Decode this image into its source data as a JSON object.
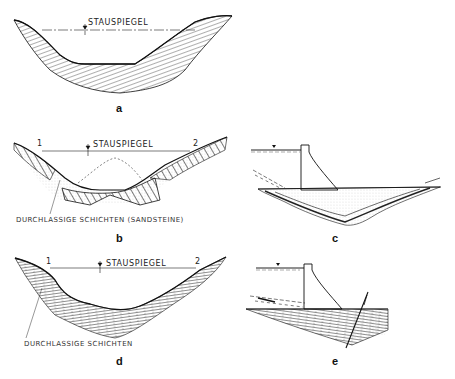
{
  "figure": {
    "panels": [
      {
        "id": "a",
        "label": "a",
        "water_level_label": "STAUSPIEGEL"
      },
      {
        "id": "b",
        "label": "b",
        "water_level_label": "STAUSPIEGEL",
        "point_left": "1",
        "point_right": "2",
        "annotation": "DURCHLASSIGE SCHICHTEN (SANDSTEINE)"
      },
      {
        "id": "c",
        "label": "c"
      },
      {
        "id": "d",
        "label": "d",
        "water_level_label": "STAUSPIEGEL",
        "point_left": "1",
        "point_right": "2",
        "annotation": "DURCHLASSIGE SCHICHTEN"
      },
      {
        "id": "e",
        "label": "e"
      }
    ],
    "colors": {
      "ink": "#1a1a1a",
      "stipple": "#888888",
      "background": "#ffffff"
    }
  }
}
